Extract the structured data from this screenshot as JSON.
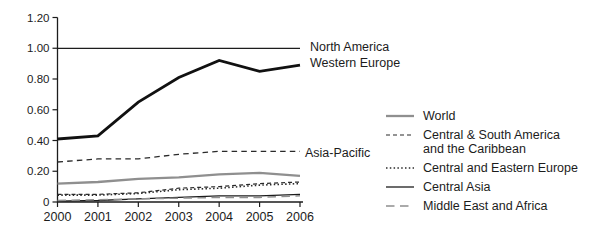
{
  "figure": {
    "background": "#ffffff",
    "text_color": "#1c1c1c",
    "axis_color": "#1c1c1c",
    "gray_line_color": "#8f8f8f"
  },
  "chart_data": {
    "type": "line",
    "title": "",
    "xlabel": "",
    "ylabel": "",
    "grid": false,
    "x": [
      2000,
      2001,
      2002,
      2003,
      2004,
      2005,
      2006
    ],
    "x_tick_labels": [
      "2000",
      "2001",
      "2002",
      "2003",
      "2004",
      "2005",
      "2006"
    ],
    "ylim": [
      0,
      1.2
    ],
    "y_ticks": [
      0,
      0.2,
      0.4,
      0.6,
      0.8,
      1.0,
      1.2
    ],
    "y_tick_labels": [
      "0",
      "0.20",
      "0.40",
      "0.60",
      "0.80",
      "1.00",
      "1.20"
    ],
    "series": [
      {
        "name": "North America",
        "color": "#1c1c1c",
        "style": "solid",
        "width": 1.15,
        "values": [
          1.0,
          1.0,
          1.0,
          1.0,
          1.0,
          1.0,
          1.0
        ]
      },
      {
        "name": "Western Europe",
        "color": "#111111",
        "style": "solid",
        "width": 2.8,
        "values": [
          0.41,
          0.43,
          0.65,
          0.81,
          0.92,
          0.85,
          0.89
        ]
      },
      {
        "name": "Asia-Pacific",
        "color": "#2a2a2a",
        "style": "dash-medium",
        "width": 1.3,
        "values": [
          0.26,
          0.28,
          0.28,
          0.31,
          0.33,
          0.33,
          0.33
        ]
      },
      {
        "name": "World",
        "color": "#8f8f8f",
        "style": "solid",
        "width": 2.3,
        "values": [
          0.12,
          0.13,
          0.15,
          0.16,
          0.18,
          0.19,
          0.17
        ]
      },
      {
        "name": "Central & South America and the Caribbean",
        "color": "#2a2a2a",
        "style": "dash-small",
        "width": 1.2,
        "values": [
          0.05,
          0.05,
          0.06,
          0.09,
          0.1,
          0.12,
          0.13
        ]
      },
      {
        "name": "Central and Eastern Europe",
        "color": "#2a2a2a",
        "style": "dotted",
        "width": 1.6,
        "values": [
          0.045,
          0.045,
          0.055,
          0.08,
          0.09,
          0.11,
          0.12
        ]
      },
      {
        "name": "Central Asia",
        "color": "#1c1c1c",
        "style": "solid",
        "width": 1.3,
        "values": [
          0.005,
          0.01,
          0.02,
          0.03,
          0.04,
          0.04,
          0.05
        ]
      },
      {
        "name": "Middle East and Africa",
        "color": "#8f8f8f",
        "style": "dash-long",
        "width": 1.5,
        "values": [
          0.01,
          0.015,
          0.02,
          0.025,
          0.03,
          0.03,
          0.04
        ]
      }
    ],
    "inline_labels": [
      {
        "text": "North America",
        "series": 0
      },
      {
        "text": "Western Europe",
        "series": 1
      },
      {
        "text": "Asia-Pacific",
        "series": 2
      }
    ],
    "legend": {
      "position": "right",
      "entries": [
        {
          "series": 3,
          "lines": [
            "World"
          ]
        },
        {
          "series": 4,
          "lines": [
            "Central & South America",
            "and the Caribbean"
          ]
        },
        {
          "series": 5,
          "lines": [
            "Central and Eastern Europe"
          ]
        },
        {
          "series": 6,
          "lines": [
            "Central Asia"
          ]
        },
        {
          "series": 7,
          "lines": [
            "Middle East and Africa"
          ]
        }
      ]
    }
  }
}
